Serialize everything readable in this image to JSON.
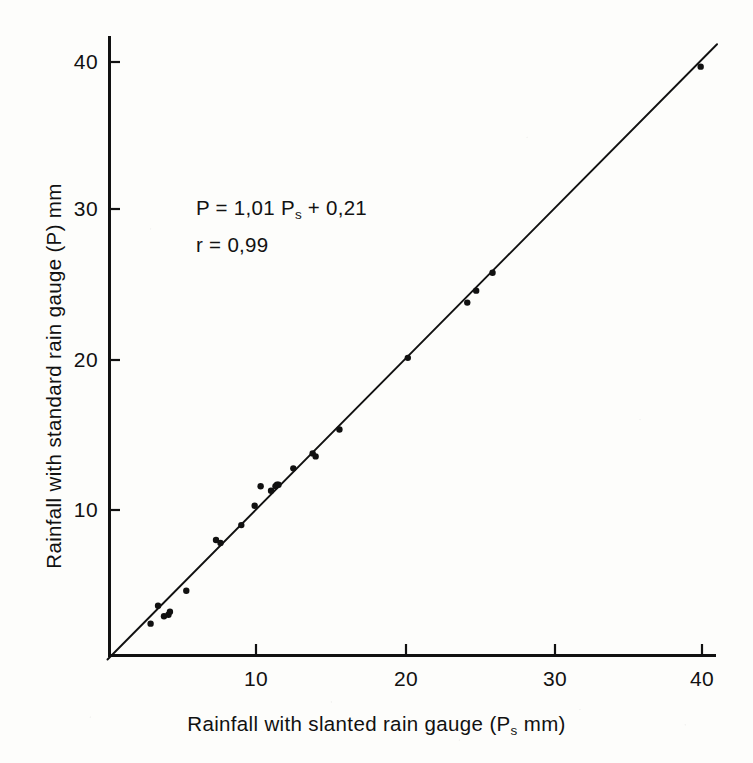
{
  "figure": {
    "background_color": "#fdfdfb",
    "ink_color": "#111111"
  },
  "annotation": {
    "equation_prefix": "P  =  1,01  P",
    "equation_subscript": "s",
    "equation_suffix": "  +  0,21",
    "correlation": "r  =  0,99"
  },
  "axes": {
    "x_title_prefix": "Rainfall with slanted rain gauge  (P",
    "x_title_subscript": "s",
    "x_title_suffix": "   mm)",
    "y_title": "Rainfall with standard rain gauge (P) mm",
    "x_ticks": [
      "10",
      "20",
      "30",
      "40"
    ],
    "y_ticks": [
      "10",
      "20",
      "30",
      "40"
    ]
  },
  "chart_data": {
    "type": "scatter",
    "title": "",
    "xlabel": "Rainfall with slanted rain gauge (Ps mm)",
    "ylabel": "Rainfall with standard rain gauge (P) mm",
    "xlim": [
      0,
      42
    ],
    "ylim": [
      0,
      42
    ],
    "x_tick_values": [
      10,
      20,
      30,
      40
    ],
    "y_tick_values": [
      10,
      20,
      30,
      40
    ],
    "grid": false,
    "legend": false,
    "annotations": [
      "P = 1,01 Ps + 0,21",
      "r = 0,99"
    ],
    "fit_line": {
      "slope": 1.01,
      "intercept": 0.21,
      "correlation": 0.99,
      "x_start": 0.0,
      "x_end": 41.0,
      "y_start": 0.0,
      "y_end": 41.2
    },
    "points": [
      {
        "x": 2.9,
        "y": 2.4
      },
      {
        "x": 3.4,
        "y": 3.6
      },
      {
        "x": 3.8,
        "y": 2.9
      },
      {
        "x": 4.1,
        "y": 3.0
      },
      {
        "x": 4.2,
        "y": 3.2
      },
      {
        "x": 5.3,
        "y": 4.6
      },
      {
        "x": 7.3,
        "y": 8.0
      },
      {
        "x": 7.6,
        "y": 7.8
      },
      {
        "x": 9.0,
        "y": 9.0
      },
      {
        "x": 9.9,
        "y": 10.3
      },
      {
        "x": 10.3,
        "y": 11.6
      },
      {
        "x": 11.0,
        "y": 11.3
      },
      {
        "x": 11.3,
        "y": 11.6
      },
      {
        "x": 11.4,
        "y": 11.7
      },
      {
        "x": 11.5,
        "y": 11.7
      },
      {
        "x": 12.5,
        "y": 12.8
      },
      {
        "x": 13.8,
        "y": 13.8
      },
      {
        "x": 14.0,
        "y": 13.6
      },
      {
        "x": 15.6,
        "y": 15.4
      },
      {
        "x": 20.2,
        "y": 20.2
      },
      {
        "x": 24.2,
        "y": 23.9
      },
      {
        "x": 24.8,
        "y": 24.7
      },
      {
        "x": 25.9,
        "y": 25.9
      },
      {
        "x": 39.9,
        "y": 39.7
      }
    ]
  }
}
